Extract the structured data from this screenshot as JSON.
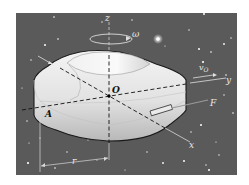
{
  "figure": {
    "labels": {
      "z_axis": "z",
      "y_axis": "y",
      "x_axis": "x",
      "origin": "O",
      "point_a": "A",
      "omega": "ω",
      "velocity": "v",
      "velocity_sub": "O",
      "force": "F",
      "radius": "r"
    },
    "colors": {
      "background": "#ffffff",
      "space": "#5a5a5a",
      "body_light": "#efefef",
      "body_shadow": "#bdbdbd",
      "axis_line": "#111111",
      "annotation": "#e0e0e0"
    }
  }
}
